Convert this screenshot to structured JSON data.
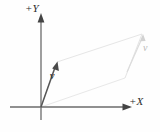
{
  "figure": {
    "caption_present": false,
    "background_color": "#fefefe",
    "axis_color": "#555555",
    "vector_color": "#4a4a4a",
    "parallelogram_color": "#e2e2e2",
    "axes": {
      "y_axis_label": "+Y",
      "x_axis_label": "+X",
      "origin_label": ""
    },
    "vectors": [
      {
        "name": "vector-v-origin",
        "label": "v",
        "tail": [
          41,
          107
        ],
        "tip": [
          57,
          62
        ],
        "color": "#4a4a4a",
        "style": "solid"
      },
      {
        "name": "vector-v-translated",
        "label": "v",
        "tail": [
          125,
          62
        ],
        "tip": [
          142,
          34
        ],
        "color": "#d6d6d6",
        "style": "faint"
      }
    ],
    "parallelogram": {
      "name": "translation-parallelogram",
      "points": [
        [
          41,
          107
        ],
        [
          57,
          62
        ],
        [
          142,
          34
        ],
        [
          125,
          62
        ]
      ],
      "stroke": "#e4e4e4",
      "fill": "none"
    },
    "icons": {
      "y_arrowhead": "arrow-up-icon",
      "x_arrowhead": "arrow-right-icon",
      "v_arrowhead": "arrow-diagonal-icon"
    }
  }
}
